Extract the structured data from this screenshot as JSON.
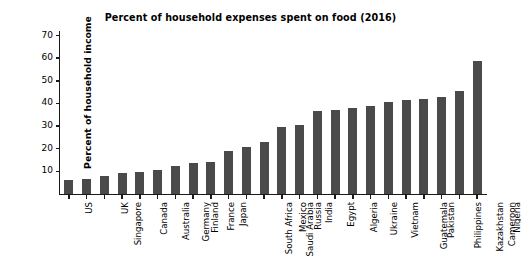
{
  "chart_data": {
    "type": "bar",
    "title": "Percent of household expenses spent on food (2016)",
    "xlabel": "",
    "ylabel": "Percent of household income",
    "categories": [
      "US",
      "Singapore",
      "UK",
      "Canada",
      "Australia",
      "Germany",
      "Finland",
      "France",
      "Japan",
      "South Africa",
      "Saudi Arabia",
      "Mexico",
      "Russia",
      "India",
      "Egypt",
      "Algeria",
      "Ukraine",
      "Vietnam",
      "Guatemala",
      "Pakistan",
      "Philippines",
      "Kazakhstan",
      "Cameroon",
      "Nigeria"
    ],
    "values": [
      6.0,
      6.7,
      8.0,
      9.1,
      9.8,
      10.6,
      12.2,
      13.6,
      14.2,
      19.0,
      20.9,
      23.1,
      29.8,
      30.3,
      36.6,
      37.3,
      38.0,
      38.7,
      40.8,
      41.6,
      41.8,
      42.8,
      45.4,
      58.9
    ],
    "yticks": [
      10,
      20,
      30,
      40,
      50,
      60,
      70
    ],
    "ylim": [
      0,
      72
    ],
    "grid": false,
    "legend": "none",
    "bar_color": "#4a4a4a",
    "axis_color": "#1a1a1a",
    "background_color": "#ffffff"
  }
}
